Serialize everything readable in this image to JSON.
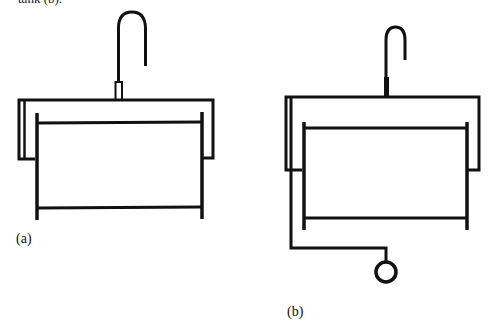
{
  "header_fragment": {
    "text": "tank (b)."
  },
  "figures": [
    {
      "id": "a",
      "label": "(a)",
      "description": "Sink with faucet, outer frame and inner basin"
    },
    {
      "id": "b",
      "label": "(b)",
      "description": "Sink with faucet, outer frame, inner basin and drain pipe to round outlet"
    }
  ],
  "colors": {
    "stroke": "#111111",
    "background": "#ffffff"
  }
}
